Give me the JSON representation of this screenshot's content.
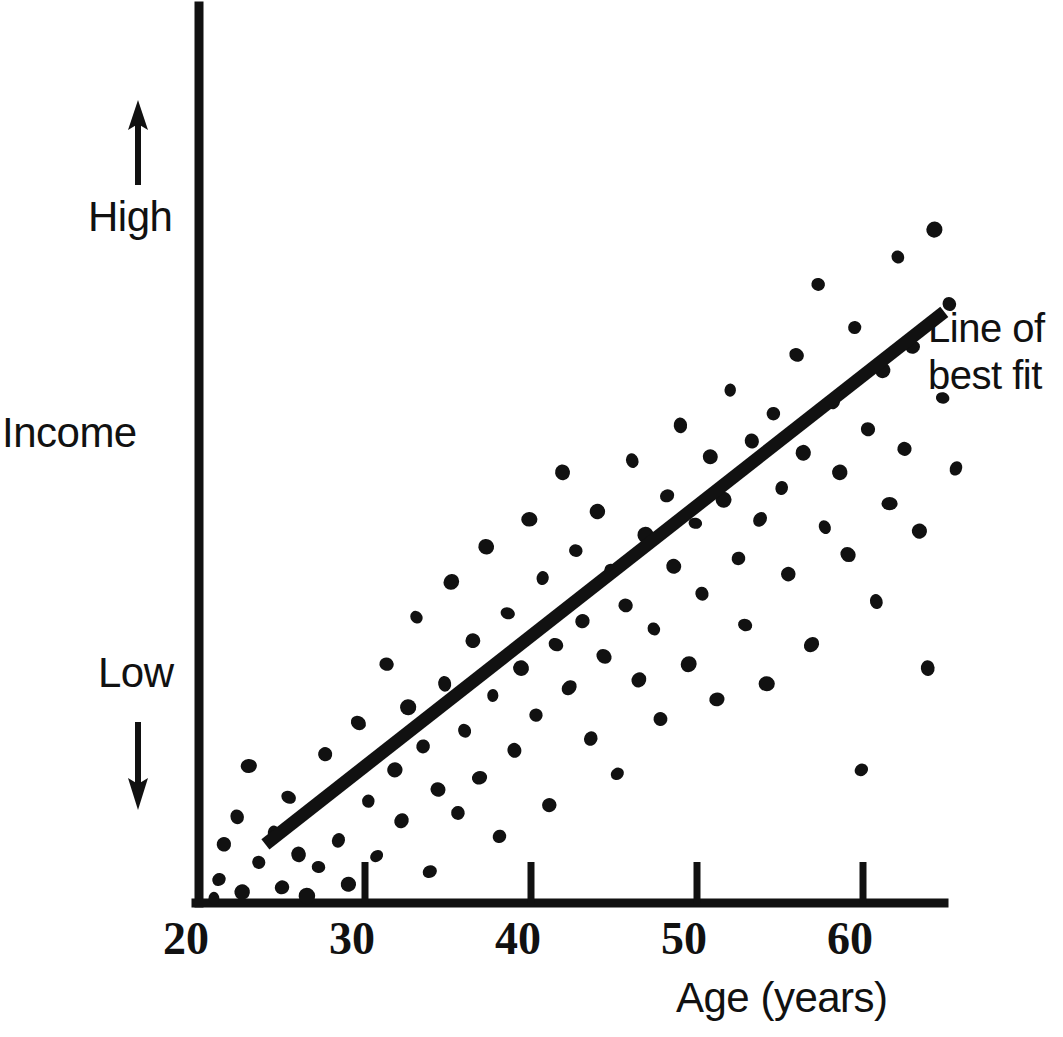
{
  "chart_data": {
    "type": "scatter",
    "title": "",
    "xlabel": "Age (years)",
    "ylabel": "Income",
    "ylabel_high": "High",
    "ylabel_low": "Low",
    "xticks": [
      20,
      30,
      40,
      50,
      60
    ],
    "xtick_labels": [
      "20",
      "30",
      "40",
      "50",
      "60"
    ],
    "yticks": [],
    "ytick_labels": [],
    "xlim": [
      19,
      66
    ],
    "ylim": [
      0,
      100
    ],
    "grid": false,
    "legend": null,
    "annotations": [
      {
        "name": "line-of-best-fit-label",
        "text_line1": "Line of",
        "text_line2": "best fit",
        "x": 66,
        "y": 72
      }
    ],
    "trendline": {
      "name": "line of best fit",
      "x_start": 24.0,
      "y_start": 7.5,
      "x_end": 64.9,
      "y_end": 75.5
    },
    "axis_arrows": {
      "up_arrow": "income-increasing",
      "down_arrow": "income-decreasing"
    },
    "points": [
      [
        20.9,
        0.6
      ],
      [
        21.2,
        3.0
      ],
      [
        21.5,
        7.5
      ],
      [
        22.3,
        11.0
      ],
      [
        22.6,
        1.4
      ],
      [
        23.0,
        17.5
      ],
      [
        23.6,
        5.2
      ],
      [
        24.5,
        9.0
      ],
      [
        25.0,
        2.0
      ],
      [
        25.4,
        13.5
      ],
      [
        26.0,
        6.2
      ],
      [
        26.5,
        0.9
      ],
      [
        27.2,
        4.6
      ],
      [
        27.6,
        19.0
      ],
      [
        28.4,
        8.0
      ],
      [
        29.0,
        2.4
      ],
      [
        29.6,
        23.0
      ],
      [
        30.2,
        13.0
      ],
      [
        30.7,
        6.0
      ],
      [
        31.3,
        30.5
      ],
      [
        31.8,
        17.0
      ],
      [
        32.2,
        10.5
      ],
      [
        32.6,
        25.0
      ],
      [
        33.1,
        36.5
      ],
      [
        33.5,
        20.0
      ],
      [
        33.9,
        4.0
      ],
      [
        34.4,
        14.5
      ],
      [
        34.8,
        28.0
      ],
      [
        35.2,
        41.0
      ],
      [
        35.6,
        11.5
      ],
      [
        36.0,
        22.0
      ],
      [
        36.5,
        33.5
      ],
      [
        36.9,
        16.0
      ],
      [
        37.3,
        45.5
      ],
      [
        37.7,
        26.5
      ],
      [
        38.1,
        8.5
      ],
      [
        38.6,
        37.0
      ],
      [
        39.0,
        19.5
      ],
      [
        39.4,
        30.0
      ],
      [
        39.9,
        49.0
      ],
      [
        40.3,
        24.0
      ],
      [
        40.7,
        41.5
      ],
      [
        41.1,
        12.5
      ],
      [
        41.5,
        33.0
      ],
      [
        41.9,
        55.0
      ],
      [
        42.3,
        27.5
      ],
      [
        42.7,
        45.0
      ],
      [
        43.1,
        36.0
      ],
      [
        43.6,
        21.0
      ],
      [
        44.0,
        50.0
      ],
      [
        44.4,
        31.5
      ],
      [
        44.8,
        42.5
      ],
      [
        45.2,
        16.5
      ],
      [
        45.7,
        38.0
      ],
      [
        46.1,
        56.5
      ],
      [
        46.5,
        28.5
      ],
      [
        46.9,
        47.0
      ],
      [
        47.4,
        35.0
      ],
      [
        47.8,
        23.5
      ],
      [
        48.2,
        52.0
      ],
      [
        48.6,
        43.0
      ],
      [
        49.0,
        61.0
      ],
      [
        49.5,
        30.5
      ],
      [
        49.9,
        48.5
      ],
      [
        50.3,
        39.5
      ],
      [
        50.8,
        57.0
      ],
      [
        51.2,
        26.0
      ],
      [
        51.6,
        51.5
      ],
      [
        52.0,
        65.5
      ],
      [
        52.5,
        44.0
      ],
      [
        52.9,
        35.5
      ],
      [
        53.3,
        59.0
      ],
      [
        53.8,
        49.0
      ],
      [
        54.2,
        28.0
      ],
      [
        54.6,
        62.5
      ],
      [
        55.1,
        53.0
      ],
      [
        55.5,
        42.0
      ],
      [
        56.0,
        70.0
      ],
      [
        56.4,
        57.5
      ],
      [
        56.9,
        33.0
      ],
      [
        57.3,
        79.0
      ],
      [
        57.7,
        48.0
      ],
      [
        58.2,
        64.0
      ],
      [
        58.6,
        55.0
      ],
      [
        59.1,
        44.5
      ],
      [
        59.5,
        73.5
      ],
      [
        59.9,
        17.0
      ],
      [
        60.3,
        60.5
      ],
      [
        60.8,
        38.5
      ],
      [
        61.2,
        68.0
      ],
      [
        61.6,
        51.0
      ],
      [
        62.1,
        82.5
      ],
      [
        62.5,
        58.0
      ],
      [
        63.0,
        71.0
      ],
      [
        63.4,
        47.5
      ],
      [
        63.9,
        30.0
      ],
      [
        64.3,
        86.0
      ],
      [
        64.8,
        64.5
      ],
      [
        65.2,
        76.5
      ],
      [
        65.6,
        55.5
      ]
    ]
  }
}
